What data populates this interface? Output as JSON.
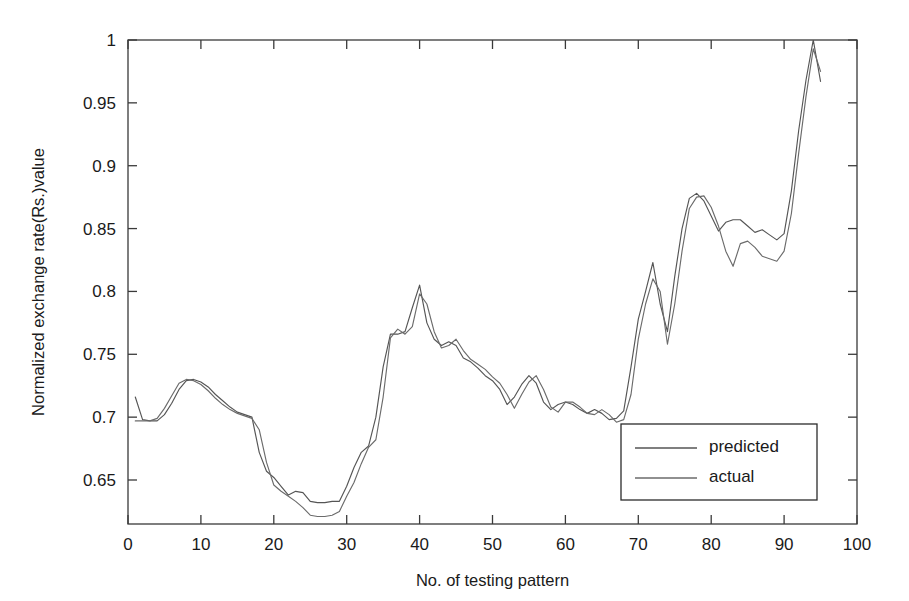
{
  "chart_data": {
    "type": "line",
    "title": "",
    "xlabel": "No. of testing pattern",
    "ylabel": "Normalized exchange rate(Rs.)value",
    "xlim": [
      0,
      100
    ],
    "ylim": [
      0.615,
      1.0
    ],
    "xticks": [
      0,
      10,
      20,
      30,
      40,
      50,
      60,
      70,
      80,
      90,
      100
    ],
    "xtick_labels": [
      "0",
      "10",
      "20",
      "30",
      "40",
      "50",
      "60",
      "70",
      "80",
      "90",
      "100"
    ],
    "yticks": [
      0.65,
      0.7,
      0.75,
      0.8,
      0.85,
      0.9,
      0.95,
      1
    ],
    "ytick_labels": [
      "0.65",
      "0.7",
      "0.75",
      "0.8",
      "0.85",
      "0.9",
      "0.95",
      "1"
    ],
    "grid": false,
    "legend_position": "lower right",
    "series": [
      {
        "name": "predicted",
        "color": "#555555",
        "x": [
          1,
          2,
          3,
          4,
          5,
          6,
          7,
          8,
          9,
          10,
          11,
          12,
          13,
          14,
          15,
          16,
          17,
          18,
          19,
          20,
          21,
          22,
          23,
          24,
          25,
          26,
          27,
          28,
          29,
          30,
          31,
          32,
          33,
          34,
          35,
          36,
          37,
          38,
          39,
          40,
          41,
          42,
          43,
          44,
          45,
          46,
          47,
          48,
          49,
          50,
          51,
          52,
          53,
          54,
          55,
          56,
          57,
          58,
          59,
          60,
          61,
          62,
          63,
          64,
          65,
          66,
          67,
          68,
          69,
          70,
          71,
          72,
          73,
          74,
          75,
          76,
          77,
          78,
          79,
          80,
          81,
          82,
          83,
          84,
          85,
          86,
          87,
          88,
          89,
          90,
          91,
          92,
          93,
          94,
          95
        ],
        "values": [
          0.716,
          0.698,
          0.697,
          0.697,
          0.702,
          0.711,
          0.722,
          0.729,
          0.73,
          0.728,
          0.724,
          0.718,
          0.713,
          0.708,
          0.704,
          0.702,
          0.7,
          0.672,
          0.657,
          0.652,
          0.645,
          0.638,
          0.641,
          0.64,
          0.633,
          0.632,
          0.632,
          0.633,
          0.633,
          0.645,
          0.66,
          0.672,
          0.677,
          0.7,
          0.74,
          0.766,
          0.766,
          0.768,
          0.787,
          0.805,
          0.775,
          0.762,
          0.757,
          0.76,
          0.757,
          0.747,
          0.744,
          0.739,
          0.733,
          0.729,
          0.722,
          0.71,
          0.716,
          0.726,
          0.733,
          0.727,
          0.712,
          0.706,
          0.71,
          0.712,
          0.71,
          0.706,
          0.703,
          0.706,
          0.703,
          0.698,
          0.699,
          0.705,
          0.74,
          0.778,
          0.8,
          0.823,
          0.79,
          0.768,
          0.812,
          0.85,
          0.874,
          0.878,
          0.872,
          0.86,
          0.848,
          0.855,
          0.857,
          0.857,
          0.852,
          0.847,
          0.849,
          0.845,
          0.841,
          0.846,
          0.88,
          0.928,
          0.968,
          1.0,
          0.967
        ]
      },
      {
        "name": "actual",
        "color": "#6b6b6b",
        "x": [
          1,
          2,
          3,
          4,
          5,
          6,
          7,
          8,
          9,
          10,
          11,
          12,
          13,
          14,
          15,
          16,
          17,
          18,
          19,
          20,
          21,
          22,
          23,
          24,
          25,
          26,
          27,
          28,
          29,
          30,
          31,
          32,
          33,
          34,
          35,
          36,
          37,
          38,
          39,
          40,
          41,
          42,
          43,
          44,
          45,
          46,
          47,
          48,
          49,
          50,
          51,
          52,
          53,
          54,
          55,
          56,
          57,
          58,
          59,
          60,
          61,
          62,
          63,
          64,
          65,
          66,
          67,
          68,
          69,
          70,
          71,
          72,
          73,
          74,
          75,
          76,
          77,
          78,
          79,
          80,
          81,
          82,
          83,
          84,
          85,
          86,
          87,
          88,
          89,
          90,
          91,
          92,
          93,
          94,
          95
        ],
        "values": [
          0.697,
          0.697,
          0.697,
          0.699,
          0.707,
          0.717,
          0.727,
          0.73,
          0.729,
          0.726,
          0.721,
          0.715,
          0.71,
          0.706,
          0.703,
          0.701,
          0.699,
          0.69,
          0.664,
          0.646,
          0.641,
          0.637,
          0.633,
          0.628,
          0.622,
          0.621,
          0.621,
          0.622,
          0.625,
          0.637,
          0.648,
          0.663,
          0.676,
          0.682,
          0.716,
          0.763,
          0.77,
          0.766,
          0.772,
          0.798,
          0.79,
          0.768,
          0.755,
          0.757,
          0.762,
          0.753,
          0.746,
          0.742,
          0.738,
          0.732,
          0.727,
          0.718,
          0.707,
          0.718,
          0.728,
          0.733,
          0.722,
          0.708,
          0.704,
          0.712,
          0.712,
          0.708,
          0.703,
          0.702,
          0.706,
          0.702,
          0.696,
          0.698,
          0.718,
          0.762,
          0.79,
          0.81,
          0.8,
          0.758,
          0.79,
          0.832,
          0.866,
          0.875,
          0.876,
          0.867,
          0.852,
          0.832,
          0.82,
          0.838,
          0.84,
          0.835,
          0.828,
          0.826,
          0.824,
          0.832,
          0.862,
          0.91,
          0.955,
          0.993,
          0.975
        ]
      }
    ]
  }
}
